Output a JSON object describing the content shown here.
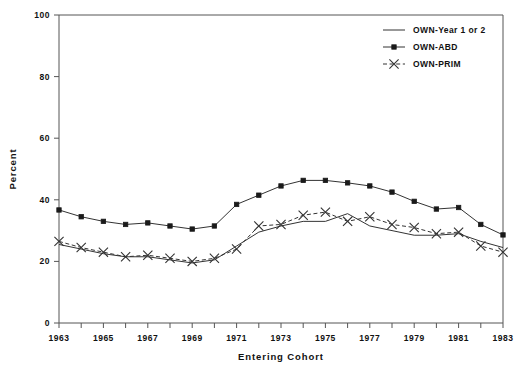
{
  "chart_data": {
    "type": "line",
    "title": "",
    "xlabel": "Entering Cohort",
    "ylabel": "Percent",
    "xlim": [
      1963,
      1983
    ],
    "ylim": [
      0,
      100
    ],
    "ytick_values": [
      0,
      20,
      40,
      60,
      80,
      100
    ],
    "ytick_labels": [
      "0",
      "20",
      "40",
      "60",
      "80",
      "100"
    ],
    "xtick_values": [
      1963,
      1964,
      1965,
      1966,
      1967,
      1968,
      1969,
      1970,
      1971,
      1972,
      1973,
      1974,
      1975,
      1976,
      1977,
      1978,
      1979,
      1980,
      1981,
      1982,
      1983
    ],
    "xtick_labels": [
      "1963",
      "",
      "1965",
      "",
      "1967",
      "",
      "1969",
      "",
      "1971",
      "",
      "1973",
      "",
      "1975",
      "",
      "1977",
      "",
      "1979",
      "",
      "1981",
      "",
      "1983"
    ],
    "grid": false,
    "legend_position": "top-right",
    "x": [
      1963,
      1964,
      1965,
      1966,
      1967,
      1968,
      1969,
      1970,
      1971,
      1972,
      1973,
      1974,
      1975,
      1976,
      1977,
      1978,
      1979,
      1980,
      1981,
      1982,
      1983
    ],
    "series": [
      {
        "name": "OWN-Year 1 or 2",
        "marker": "none",
        "linestyle": "solid",
        "values": [
          25.5,
          24.0,
          22.5,
          21.5,
          21.5,
          20.5,
          19.5,
          20.5,
          25.0,
          29.5,
          31.5,
          33.0,
          33.0,
          35.5,
          31.5,
          30.0,
          28.5,
          28.5,
          29.0,
          26.5,
          24.5
        ]
      },
      {
        "name": "OWN-ABD",
        "marker": "filled-square",
        "linestyle": "solid",
        "values": [
          36.7,
          34.5,
          33.0,
          32.0,
          32.5,
          31.5,
          30.5,
          31.5,
          38.5,
          41.5,
          44.5,
          46.3,
          46.3,
          45.5,
          44.5,
          42.5,
          39.5,
          37.0,
          37.5,
          32.0,
          28.6
        ]
      },
      {
        "name": "OWN-PRIM",
        "marker": "x",
        "linestyle": "dashed",
        "values": [
          26.5,
          24.5,
          23.0,
          21.5,
          22.0,
          21.0,
          20.0,
          21.0,
          24.0,
          31.5,
          32.0,
          35.0,
          36.0,
          33.0,
          34.5,
          32.0,
          31.0,
          29.0,
          29.5,
          25.0,
          23.0
        ]
      }
    ]
  },
  "legend": {
    "items": [
      {
        "label": "OWN-Year 1 or 2",
        "style": "line"
      },
      {
        "label": "OWN-ABD",
        "style": "line-square"
      },
      {
        "label": "OWN-PRIM",
        "style": "dashed-x"
      }
    ]
  },
  "axis": {
    "x_title": "Entering Cohort",
    "y_title": "Percent"
  }
}
